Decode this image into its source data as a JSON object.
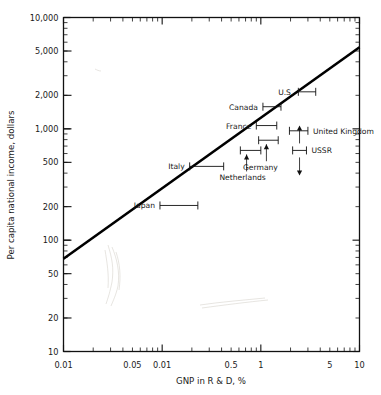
{
  "chart_data": {
    "type": "scatter",
    "title": "",
    "xlabel": "GNP in R & D, %",
    "ylabel": "Per capita national income, dollars",
    "xscale": "log",
    "yscale": "log",
    "xlim": [
      0.01,
      10
    ],
    "ylim": [
      10,
      10000
    ],
    "grid": false,
    "legend": false,
    "xticks": [
      {
        "value": 0.01,
        "label": "0.01"
      },
      {
        "value": 0.05,
        "label": "0.05"
      },
      {
        "value": 0.1,
        "label": "0.01"
      },
      {
        "value": 0.5,
        "label": "0.5"
      },
      {
        "value": 1,
        "label": "1"
      },
      {
        "value": 5,
        "label": "5"
      },
      {
        "value": 10,
        "label": "10"
      }
    ],
    "yticks": [
      {
        "value": 10,
        "label": "10"
      },
      {
        "value": 20,
        "label": "20"
      },
      {
        "value": 50,
        "label": "50"
      },
      {
        "value": 100,
        "label": "100"
      },
      {
        "value": 200,
        "label": "200"
      },
      {
        "value": 500,
        "label": "500"
      },
      {
        "value": 1000,
        "label": "1,000"
      },
      {
        "value": 2000,
        "label": "2,000"
      },
      {
        "value": 5000,
        "label": "5,000"
      },
      {
        "value": 10000,
        "label": "10,000"
      }
    ],
    "trendline": {
      "x": [
        0.01,
        10
      ],
      "y": [
        68,
        5400
      ]
    },
    "points": [
      {
        "name": "U.S.",
        "label": "U.S.",
        "y": 2150,
        "x_low": 2.4,
        "x_high": 3.6,
        "label_side": "left",
        "connector": "none"
      },
      {
        "name": "Canada",
        "label": "Canada",
        "y": 1580,
        "x_low": 1.05,
        "x_high": 1.6,
        "label_side": "left",
        "connector": "none"
      },
      {
        "name": "France",
        "label": "France",
        "y": 1070,
        "x_low": 0.9,
        "x_high": 1.45,
        "label_side": "left",
        "connector": "none"
      },
      {
        "name": "United Kingdom",
        "label": "United Kingdom",
        "y": 960,
        "x_low": 1.95,
        "x_high": 3.0,
        "label_side": "right",
        "connector": "none"
      },
      {
        "name": "Germany",
        "label": "Germany",
        "y": 790,
        "x_low": 0.95,
        "x_high": 1.5,
        "label_side": "below",
        "connector": "arrow-up"
      },
      {
        "name": "Netherlands",
        "label": "Netherlands",
        "y": 640,
        "x_low": 0.62,
        "x_high": 1.0,
        "label_side": "below",
        "connector": "arrow-up"
      },
      {
        "name": "USSR",
        "label": "USSR",
        "y": 640,
        "x_low": 2.1,
        "x_high": 2.9,
        "label_side": "right",
        "connector": "arrows-vertical"
      },
      {
        "name": "Italy",
        "label": "Italy",
        "y": 460,
        "x_low": 0.19,
        "x_high": 0.42,
        "label_side": "left",
        "connector": "none"
      },
      {
        "name": "Japan",
        "label": "Japan",
        "y": 205,
        "x_low": 0.095,
        "x_high": 0.23,
        "label_side": "left",
        "connector": "none"
      }
    ]
  }
}
